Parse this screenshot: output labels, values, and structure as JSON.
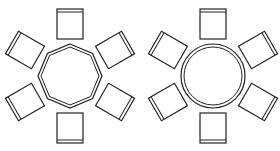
{
  "diagram": {
    "background": "#ffffff",
    "line_color": "#222222",
    "layouts": [
      {
        "name": "octagonal-table-layout",
        "table_shape": "octagon",
        "center": [
          70,
          76
        ],
        "table_radius": 31,
        "chairs": 6
      },
      {
        "name": "circular-table-layout",
        "table_shape": "circle",
        "center": [
          213,
          76
        ],
        "table_radius": 31,
        "chairs": 6
      }
    ]
  }
}
